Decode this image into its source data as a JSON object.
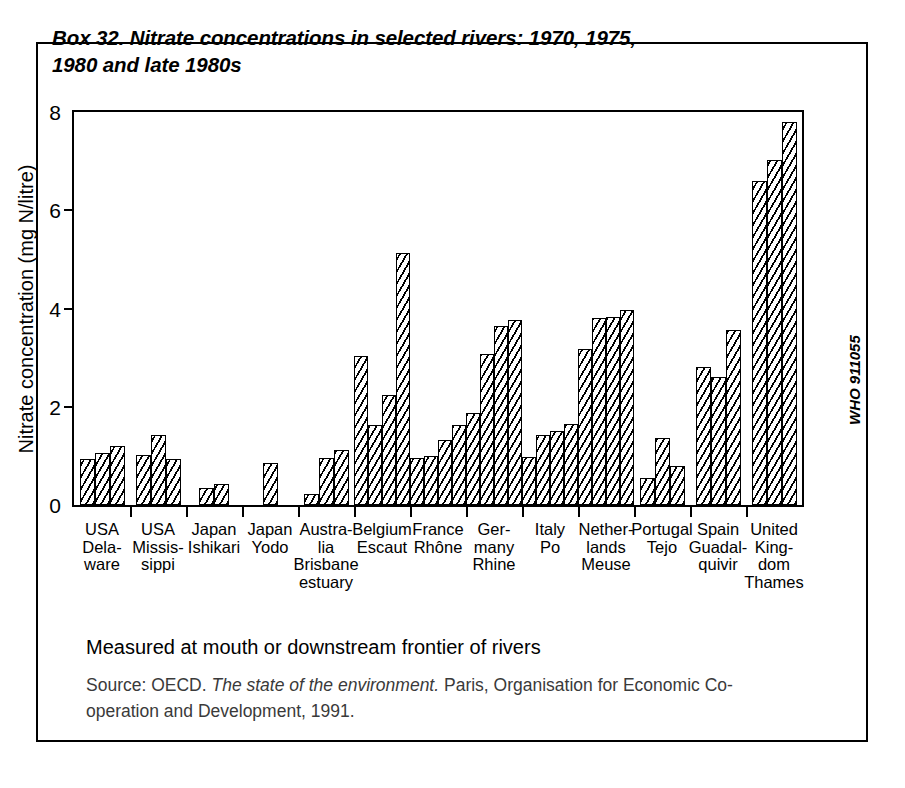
{
  "box": {
    "title": "Box 32. Nitrate concentrations in selected rivers: 1970, 1975, 1980 and late 1980s",
    "measured_note": "Measured at mouth or downstream frontier of rivers",
    "source_prefix": "Source: OECD. ",
    "source_italic": "The state of the environment.",
    "source_suffix": " Paris, Organisation for Economic Co-operation and Development, 1991.",
    "who_code": "WHO 911055"
  },
  "chart_data": {
    "type": "bar",
    "title": "Box 32. Nitrate concentrations in selected rivers: 1970, 1975, 1980 and late 1980s",
    "xlabel": "",
    "ylabel": "Nitrate concentration (mg N/litre)",
    "ylim": [
      0,
      8
    ],
    "yticks": [
      0,
      2,
      4,
      6,
      8
    ],
    "grid": false,
    "legend": false,
    "legend_position": "none",
    "note": "Measured at mouth or downstream frontier of rivers",
    "series_meaning": "Successive bars within each group correspond to 1970, 1975, 1980 and late 1980s where available",
    "categories": [
      "USA\nDela-\nware",
      "USA\nMissis-\nsippi",
      "Japan\nIshikari",
      "Japan\nYodo",
      "Austra-\nlia\nBrisbane\nestuary",
      "Belgium\nEscaut",
      "France\nRhône",
      "Ger-\nmany\nRhine",
      "Italy\nPo",
      "Nether-\nlands\nMeuse",
      "Portugal\nTejo",
      "Spain\nGuadal-\nquivir",
      "United\nKing-\ndom\nThames"
    ],
    "groups": [
      {
        "category": "USA Delaware",
        "values": [
          0.93,
          1.05,
          1.21
        ]
      },
      {
        "category": "USA Mississippi",
        "values": [
          1.02,
          1.43,
          0.93
        ]
      },
      {
        "category": "Japan Ishikari",
        "values": [
          0.35,
          0.43
        ]
      },
      {
        "category": "Japan Yodo",
        "values": [
          0.85
        ]
      },
      {
        "category": "Australia Brisbane estuary",
        "values": [
          0.23,
          0.95,
          1.13
        ]
      },
      {
        "category": "Belgium Escaut",
        "values": [
          3.03,
          1.62,
          2.23,
          5.13
        ]
      },
      {
        "category": "France Rhône",
        "values": [
          0.95,
          1.0,
          1.32,
          1.63
        ]
      },
      {
        "category": "Germany Rhine",
        "values": [
          1.87,
          3.07,
          3.65,
          3.76
        ]
      },
      {
        "category": "Italy Po",
        "values": [
          0.97,
          1.43,
          1.5,
          1.65
        ]
      },
      {
        "category": "Netherlands Meuse",
        "values": [
          3.17,
          3.8,
          3.83,
          3.97
        ]
      },
      {
        "category": "Portugal Tejo",
        "values": [
          0.56,
          1.37,
          0.8
        ]
      },
      {
        "category": "Spain Guadalquivir",
        "values": [
          2.8,
          2.6,
          3.57
        ]
      },
      {
        "category": "United Kingdom Thames",
        "values": [
          6.6,
          7.02,
          7.8
        ]
      }
    ]
  }
}
